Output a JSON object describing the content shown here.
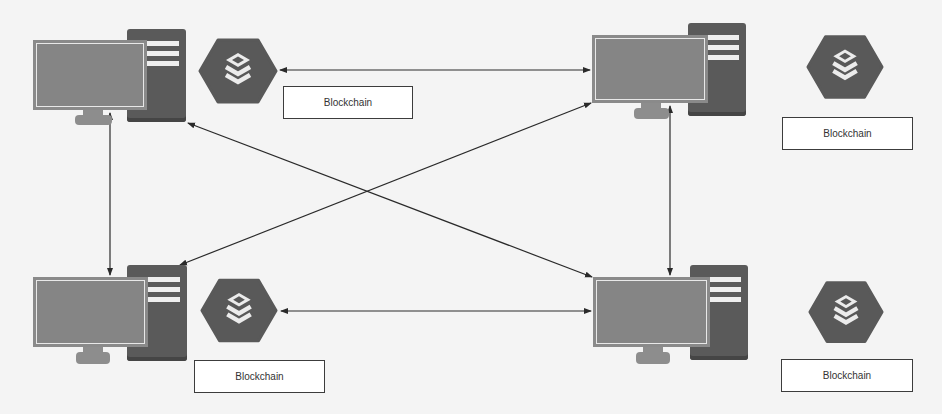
{
  "diagram": {
    "type": "peer-to-peer blockchain network",
    "colors": {
      "background": "#f4f4f4",
      "tower": "#5a5a5a",
      "monitor": "#8a8a8a",
      "hexagon": "#595959",
      "edge": "#2a2a2a",
      "label_border": "#3c3c3c"
    },
    "nodes": [
      {
        "id": "top-left",
        "icon": "desktop-computer-icon",
        "blockchain_icon": "database-stack-icon",
        "label": "Blockchain"
      },
      {
        "id": "top-right",
        "icon": "desktop-computer-icon",
        "blockchain_icon": "database-stack-icon",
        "label": "Blockchain"
      },
      {
        "id": "bottom-left",
        "icon": "desktop-computer-icon",
        "blockchain_icon": "database-stack-icon",
        "label": "Blockchain"
      },
      {
        "id": "bottom-right",
        "icon": "desktop-computer-icon",
        "blockchain_icon": "database-stack-icon",
        "label": "Blockchain"
      }
    ],
    "edges": [
      {
        "from": "top-left",
        "to": "top-right",
        "bidirectional": true
      },
      {
        "from": "bottom-left",
        "to": "bottom-right",
        "bidirectional": true
      },
      {
        "from": "top-left",
        "to": "bottom-left",
        "bidirectional": true
      },
      {
        "from": "top-right",
        "to": "bottom-right",
        "bidirectional": true
      },
      {
        "from": "top-left",
        "to": "bottom-right",
        "bidirectional": true
      },
      {
        "from": "bottom-left",
        "to": "top-right",
        "bidirectional": true
      }
    ]
  }
}
